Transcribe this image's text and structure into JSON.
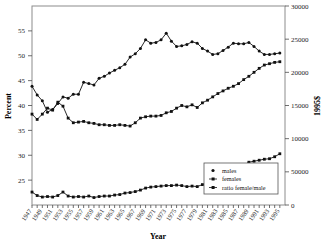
{
  "chart_data": {
    "type": "line",
    "title": "",
    "xlabel": "Year",
    "ylabel": "Percent",
    "y2label": "1995$",
    "grid": false,
    "legend_position": "bottom-right",
    "xlim": [
      1947,
      1996
    ],
    "ylim": [
      20,
      60
    ],
    "y2lim": [
      0,
      30000
    ],
    "xticks": [
      "1947",
      "1949",
      "1951",
      "1953",
      "1955",
      "1957",
      "1959",
      "1961",
      "1963",
      "1965",
      "1967",
      "1969",
      "1971",
      "1973",
      "1975",
      "1977",
      "1979",
      "1981",
      "1983",
      "1985",
      "1987",
      "1989",
      "1991",
      "1993",
      "1995"
    ],
    "yticks": [
      "25",
      "30",
      "35",
      "40",
      "45",
      "50",
      "55"
    ],
    "y2ticks": [
      "0",
      "50000",
      "10000",
      "15000",
      "20000",
      "25000",
      "30000"
    ],
    "x": [
      1947,
      1948,
      1949,
      1950,
      1951,
      1952,
      1953,
      1954,
      1955,
      1956,
      1957,
      1958,
      1959,
      1960,
      1961,
      1962,
      1963,
      1964,
      1965,
      1966,
      1967,
      1968,
      1969,
      1970,
      1971,
      1972,
      1973,
      1974,
      1975,
      1976,
      1977,
      1978,
      1979,
      1980,
      1981,
      1982,
      1983,
      1984,
      1985,
      1986,
      1987,
      1988,
      1989,
      1990,
      1991,
      1992,
      1993,
      1994,
      1995
    ],
    "series": [
      {
        "name": "males",
        "axis": "right",
        "unit": "1995$",
        "values": [
          17900,
          16600,
          15700,
          14000,
          14400,
          15300,
          16300,
          16100,
          16700,
          16700,
          18500,
          18300,
          18100,
          19100,
          19400,
          19900,
          20300,
          20700,
          21200,
          22300,
          22800,
          23600,
          24900,
          24400,
          24500,
          24900,
          25900,
          24700,
          23900,
          24000,
          24200,
          24600,
          24400,
          23600,
          23200,
          22700,
          22800,
          23300,
          23800,
          24400,
          24300,
          24300,
          24500,
          23900,
          23200,
          22700,
          22700,
          22800,
          22900
        ]
      },
      {
        "name": "females",
        "axis": "right",
        "unit": "1995$",
        "values": [
          13700,
          12900,
          13700,
          14600,
          14300,
          15500,
          14900,
          13100,
          12400,
          12500,
          12600,
          12400,
          12300,
          12100,
          12100,
          12000,
          12000,
          12100,
          12000,
          11900,
          12400,
          13100,
          13300,
          13400,
          13400,
          13500,
          13900,
          14100,
          14600,
          15000,
          14800,
          15100,
          14700,
          15400,
          15800,
          16300,
          16800,
          17200,
          17600,
          17900,
          18300,
          18900,
          19400,
          20000,
          20600,
          21100,
          21300,
          21500,
          21600
        ]
      },
      {
        "name": "ratio female/male",
        "axis": "left",
        "unit": "percent",
        "values": [
          22.6,
          21.9,
          21.6,
          21.7,
          21.6,
          21.9,
          22.6,
          21.8,
          21.6,
          21.7,
          21.6,
          21.8,
          21.5,
          21.7,
          21.8,
          21.8,
          22.0,
          22.1,
          22.4,
          22.5,
          22.7,
          23.0,
          23.4,
          23.6,
          23.7,
          23.8,
          23.9,
          23.9,
          24.0,
          23.9,
          23.7,
          23.8,
          23.7,
          24.1,
          24.4,
          24.7,
          25.1,
          25.6,
          26.0,
          26.6,
          27.3,
          28.0,
          28.6,
          28.8,
          29.0,
          29.2,
          29.3,
          29.7,
          30.3
        ]
      }
    ],
    "legend": [
      {
        "label": "males",
        "marker": "circle"
      },
      {
        "label": "females",
        "marker": "square"
      },
      {
        "label": "ratio female/male",
        "marker": "square"
      }
    ]
  }
}
